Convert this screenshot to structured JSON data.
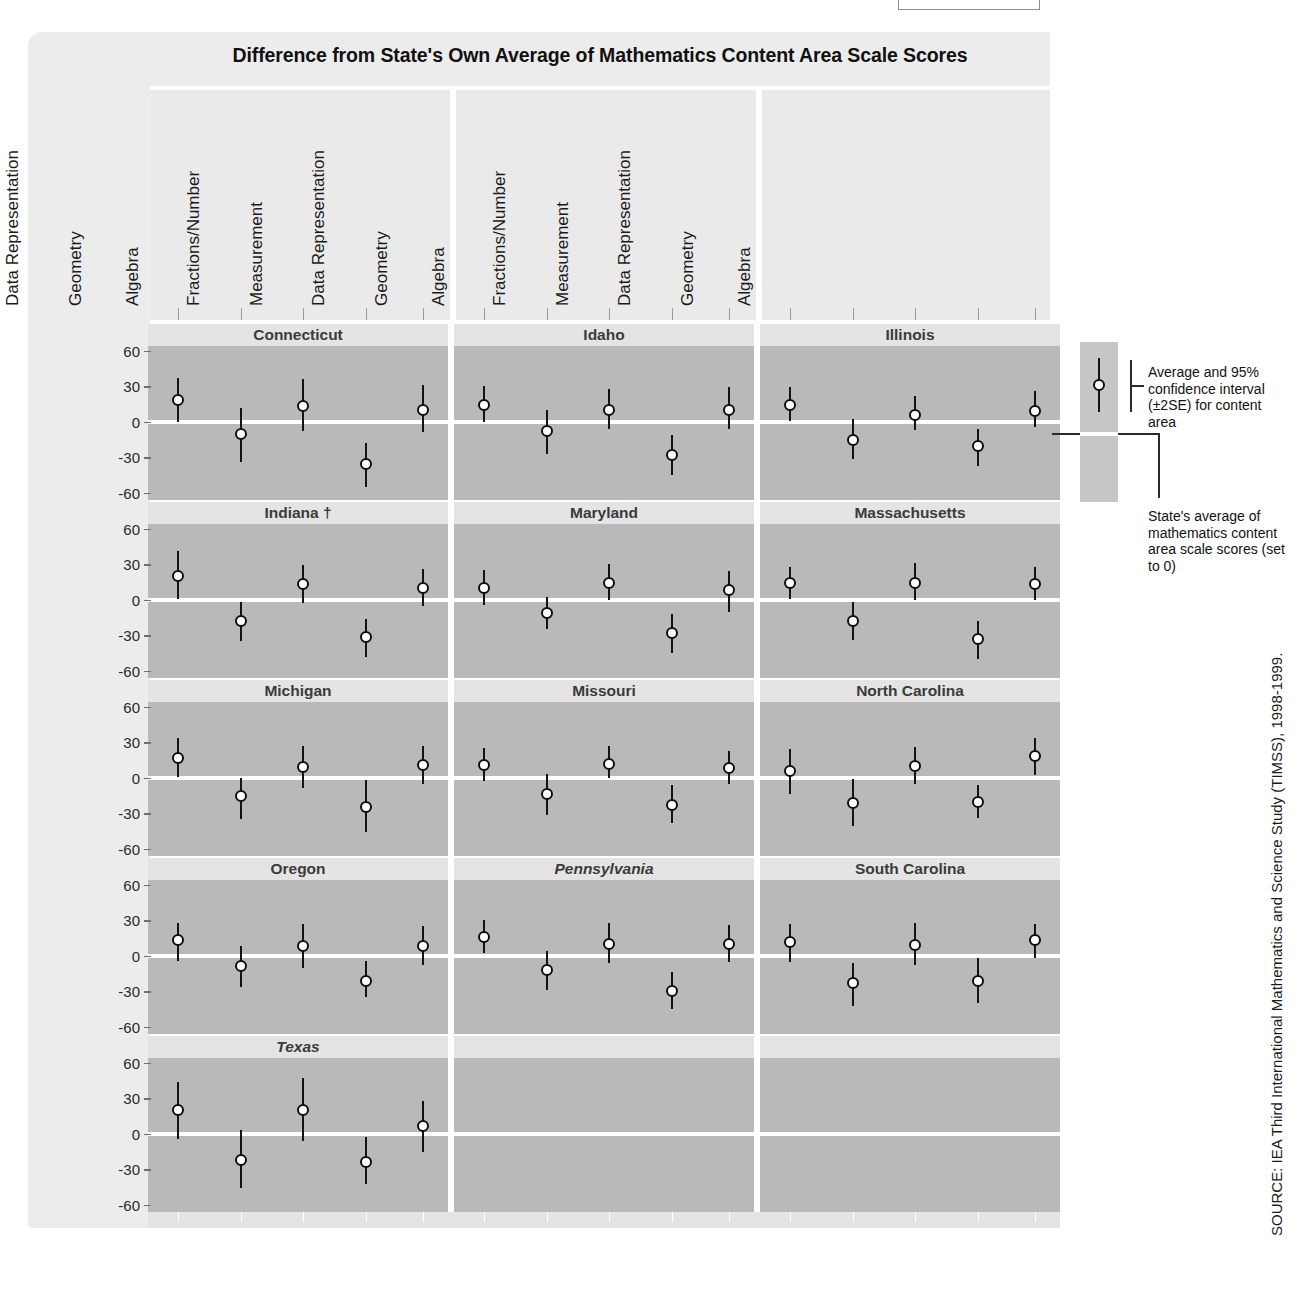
{
  "title": "Difference from State's Own Average of Mathematics Content Area Scale Scores",
  "content_areas": [
    "Fractions/Number",
    "Measurement",
    "Data Representation",
    "Geometry",
    "Algebra"
  ],
  "y_ticks": [
    "60",
    "30",
    "0",
    "-30",
    "-60"
  ],
  "legend": {
    "item1": "Average and 95% confidence interval (±2SE) for content area",
    "item2": "State's average of mathematics content area scale scores (set to 0)"
  },
  "source": "SOURCE: IEA Third International Mathematics and Science Study (TIMSS), 1998-1999.",
  "panel_titles": [
    "Connecticut",
    "Idaho",
    "Illinois",
    "Indiana †",
    "Maryland",
    "Massachusetts",
    "Michigan",
    "Missouri",
    "North Carolina",
    "Oregon",
    "Pennsylvania",
    "South Carolina",
    "Texas",
    "",
    ""
  ],
  "chart_data": {
    "type": "scatter",
    "title": "Difference from State's Own Average of Mathematics Content Area Scale Scores",
    "xlabel": "",
    "ylabel": "Difference from state's own average scale score",
    "ylim": [
      -60,
      60
    ],
    "yticks": [
      60,
      30,
      0,
      -30,
      -60
    ],
    "grid": false,
    "legend_position": "right",
    "error_bar_note": "Vertical bars are 95% confidence intervals (±2SE); white reference line at 0 is the state's own average.",
    "categories": [
      "Fractions/Number",
      "Measurement",
      "Data Representation",
      "Geometry",
      "Algebra"
    ],
    "panels": [
      {
        "name": "Connecticut",
        "italic": false,
        "dagger": false,
        "values": [
          18,
          -10,
          13,
          -36,
          10
        ],
        "low": [
          0,
          -34,
          -8,
          -55,
          -9
        ],
        "high": [
          37,
          12,
          36,
          -18,
          31
        ]
      },
      {
        "name": "Idaho",
        "italic": false,
        "dagger": false,
        "values": [
          14,
          -8,
          10,
          -28,
          10
        ],
        "low": [
          0,
          -27,
          -6,
          -45,
          -6
        ],
        "high": [
          30,
          10,
          28,
          -11,
          29
        ]
      },
      {
        "name": "Illinois",
        "italic": false,
        "dagger": false,
        "values": [
          14,
          -15,
          6,
          -20,
          9
        ],
        "low": [
          1,
          -31,
          -7,
          -37,
          -4
        ],
        "high": [
          29,
          2,
          22,
          -6,
          26
        ]
      },
      {
        "name": "Indiana †",
        "italic": false,
        "dagger": true,
        "values": [
          20,
          -18,
          13,
          -31,
          10
        ],
        "low": [
          1,
          -35,
          -3,
          -48,
          -5
        ],
        "high": [
          41,
          -2,
          29,
          -16,
          26
        ]
      },
      {
        "name": "Maryland",
        "italic": false,
        "dagger": false,
        "values": [
          10,
          -11,
          14,
          -28,
          8
        ],
        "low": [
          -4,
          -25,
          0,
          -45,
          -10
        ],
        "high": [
          25,
          2,
          30,
          -12,
          24
        ]
      },
      {
        "name": "Massachusetts",
        "italic": false,
        "dagger": false,
        "values": [
          14,
          -18,
          14,
          -33,
          13
        ],
        "low": [
          1,
          -34,
          0,
          -50,
          0
        ],
        "high": [
          28,
          -2,
          31,
          -18,
          28
        ]
      },
      {
        "name": "Michigan",
        "italic": false,
        "dagger": false,
        "values": [
          17,
          -15,
          9,
          -25,
          11
        ],
        "low": [
          1,
          -35,
          -9,
          -46,
          -5
        ],
        "high": [
          34,
          0,
          27,
          -2,
          27
        ]
      },
      {
        "name": "Missouri",
        "italic": false,
        "dagger": false,
        "values": [
          11,
          -14,
          12,
          -23,
          8
        ],
        "low": [
          -3,
          -31,
          0,
          -38,
          -5
        ],
        "high": [
          25,
          3,
          27,
          -6,
          23
        ]
      },
      {
        "name": "North Carolina",
        "italic": false,
        "dagger": false,
        "values": [
          6,
          -21,
          10,
          -20,
          18
        ],
        "low": [
          -14,
          -41,
          -5,
          -34,
          2
        ],
        "high": [
          24,
          -1,
          26,
          -6,
          34
        ]
      },
      {
        "name": "Oregon",
        "italic": false,
        "dagger": false,
        "values": [
          13,
          -9,
          8,
          -21,
          8
        ],
        "low": [
          -4,
          -26,
          -10,
          -35,
          -8
        ],
        "high": [
          28,
          8,
          27,
          -4,
          25
        ]
      },
      {
        "name": "Pennsylvania",
        "italic": true,
        "dagger": false,
        "values": [
          16,
          -12,
          10,
          -30,
          10
        ],
        "low": [
          2,
          -29,
          -6,
          -45,
          -5
        ],
        "high": [
          30,
          4,
          28,
          -14,
          26
        ]
      },
      {
        "name": "South Carolina",
        "italic": false,
        "dagger": false,
        "values": [
          12,
          -23,
          9,
          -21,
          13
        ],
        "low": [
          -5,
          -42,
          -8,
          -40,
          -2
        ],
        "high": [
          27,
          -6,
          28,
          -2,
          27
        ]
      },
      {
        "name": "Texas",
        "italic": true,
        "dagger": false,
        "values": [
          20,
          -22,
          20,
          -24,
          7
        ],
        "low": [
          -4,
          -46,
          -6,
          -42,
          -15
        ],
        "high": [
          44,
          3,
          47,
          -3,
          28
        ]
      }
    ]
  }
}
